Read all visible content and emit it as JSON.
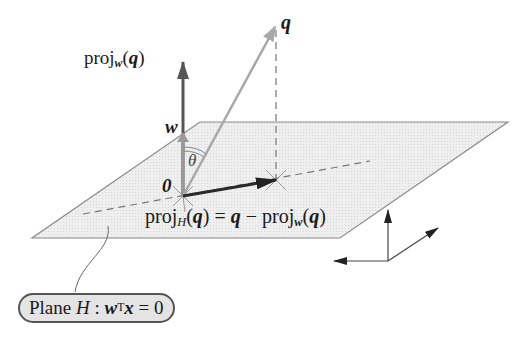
{
  "labels": {
    "q": "q",
    "w": "w",
    "zero": "0",
    "theta": "θ",
    "proj_w": {
      "prefix": "proj",
      "sub": "w",
      "arg_open": "(",
      "arg": "q",
      "arg_close": ")"
    },
    "proj_H": {
      "prefix": "proj",
      "sub": "H",
      "arg_open": "(",
      "arg": "q",
      "arg_close": ")",
      "eq": " = ",
      "q": "q",
      "minus": " − ",
      "prefix2": "proj",
      "sub2": "w",
      "arg2_open": "(",
      "arg2": "q",
      "arg2_close": ")"
    },
    "plane": {
      "text1": "Plane ",
      "H": "H",
      "colon": " : ",
      "w": "w",
      "T": "T",
      "x": "x",
      "eq": " = 0"
    }
  },
  "colors": {
    "plane_fill": "#ececec",
    "plane_edge": "#8a8a8a",
    "proj_w_arrow": "#555555",
    "w_arrow": "#9a9a9a",
    "q_arrow": "#a8a8a8",
    "proj_H_arrow": "#2a2a2a",
    "dashed": "#777777",
    "axes": "#333333",
    "label_box_fill": "#e4e4e4"
  },
  "geometry": {
    "origin": [
      183,
      196
    ],
    "q_tip": [
      275,
      27
    ],
    "proj_point": [
      276,
      180
    ],
    "proj_w_tip": [
      183,
      62
    ],
    "w_tip": [
      183,
      135
    ],
    "plane": [
      [
        200,
        122
      ],
      [
        508,
        122
      ],
      [
        340,
        238
      ],
      [
        32,
        238
      ]
    ]
  }
}
